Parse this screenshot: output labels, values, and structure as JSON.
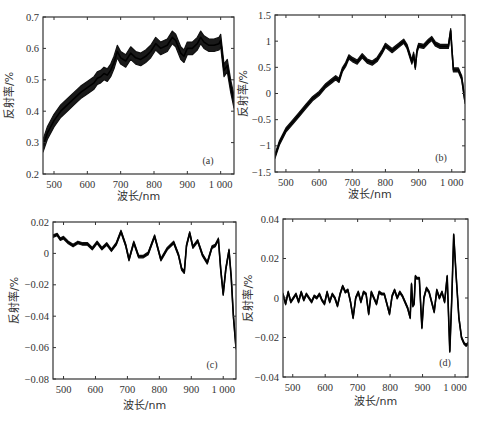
{
  "figure": {
    "xlabel": "波长/nm",
    "ylabel": "反射率/%"
  },
  "chart_data": [
    {
      "type": "line",
      "panel": "(a)",
      "xlabel": "波长/nm",
      "ylabel": "反射率/%",
      "xlim": [
        467,
        1040
      ],
      "ylim": [
        0.2,
        0.7
      ],
      "xticks": [
        500,
        600,
        700,
        800,
        900,
        1000
      ],
      "xticklabels": [
        "500",
        "600",
        "700",
        "800",
        "900",
        "1 000"
      ],
      "yticks": [
        0.2,
        0.3,
        0.4,
        0.5,
        0.6,
        0.7
      ],
      "yticklabels": [
        "0.2",
        "0.3",
        "0.4",
        "0.5",
        "0.6",
        "0.7"
      ],
      "band_halfwidth": 0.02,
      "x": [
        467,
        480,
        500,
        520,
        540,
        560,
        580,
        600,
        620,
        630,
        640,
        650,
        660,
        670,
        680,
        690,
        700,
        715,
        730,
        745,
        760,
        775,
        790,
        805,
        820,
        840,
        855,
        865,
        880,
        890,
        900,
        915,
        930,
        940,
        950,
        965,
        980,
        995,
        1000,
        1010,
        1020,
        1030,
        1040
      ],
      "y": [
        0.29,
        0.33,
        0.37,
        0.4,
        0.42,
        0.44,
        0.46,
        0.475,
        0.49,
        0.505,
        0.51,
        0.52,
        0.515,
        0.53,
        0.555,
        0.59,
        0.57,
        0.56,
        0.585,
        0.57,
        0.565,
        0.575,
        0.59,
        0.615,
        0.6,
        0.61,
        0.635,
        0.625,
        0.585,
        0.575,
        0.6,
        0.6,
        0.615,
        0.635,
        0.62,
        0.61,
        0.61,
        0.615,
        0.625,
        0.53,
        0.545,
        0.48,
        0.43
      ]
    },
    {
      "type": "line",
      "panel": "(b)",
      "xlabel": "波长/nm",
      "ylabel": "反射率/%",
      "xlim": [
        467,
        1040
      ],
      "ylim": [
        -1.5,
        1.5
      ],
      "xticks": [
        500,
        600,
        700,
        800,
        900,
        1000
      ],
      "xticklabels": [
        "500",
        "600",
        "700",
        "800",
        "900",
        "1 000"
      ],
      "yticks": [
        -1.5,
        -1,
        -0.5,
        0,
        0.5,
        1,
        1.5
      ],
      "yticklabels": [
        "-1.5",
        "-1",
        "-0.5",
        "0",
        "0.5",
        "1",
        "1.5"
      ],
      "band_halfwidth": 0.04,
      "x": [
        467,
        480,
        500,
        520,
        540,
        560,
        580,
        600,
        620,
        640,
        650,
        660,
        670,
        680,
        690,
        700,
        715,
        730,
        745,
        760,
        775,
        790,
        800,
        820,
        840,
        855,
        865,
        875,
        880,
        885,
        890,
        895,
        900,
        915,
        930,
        940,
        950,
        965,
        980,
        990,
        997,
        1000,
        1005,
        1020,
        1030,
        1040
      ],
      "y": [
        -1.2,
        -0.95,
        -0.7,
        -0.55,
        -0.4,
        -0.25,
        -0.1,
        0.0,
        0.15,
        0.25,
        0.3,
        0.25,
        0.45,
        0.55,
        0.7,
        0.65,
        0.6,
        0.72,
        0.62,
        0.58,
        0.65,
        0.8,
        0.92,
        0.82,
        0.92,
        1.0,
        0.9,
        0.7,
        0.6,
        0.75,
        0.5,
        0.8,
        0.92,
        0.9,
        1.0,
        1.05,
        0.95,
        0.9,
        0.9,
        0.9,
        1.2,
        0.9,
        0.45,
        0.45,
        0.3,
        -0.15
      ]
    },
    {
      "type": "line",
      "panel": "(c)",
      "xlabel": "波长/nm",
      "ylabel": "反射率/%",
      "xlim": [
        467,
        1040
      ],
      "ylim": [
        -0.08,
        0.02
      ],
      "xticks": [
        500,
        600,
        700,
        800,
        900,
        1000
      ],
      "xticklabels": [
        "500",
        "600",
        "700",
        "800",
        "900",
        "1 000"
      ],
      "yticks": [
        -0.08,
        -0.06,
        -0.04,
        -0.02,
        0,
        0.02
      ],
      "yticklabels": [
        "-0.08",
        "-0.06",
        "-0.04",
        "-0.02",
        "0",
        "0.02"
      ],
      "band_halfwidth": 0.0008,
      "x": [
        467,
        480,
        490,
        500,
        515,
        530,
        545,
        560,
        575,
        590,
        605,
        620,
        635,
        650,
        665,
        680,
        695,
        705,
        720,
        735,
        750,
        765,
        785,
        805,
        825,
        845,
        860,
        870,
        878,
        885,
        895,
        905,
        920,
        935,
        950,
        965,
        975,
        985,
        992,
        1000,
        1008,
        1018,
        1025,
        1032,
        1040
      ],
      "y": [
        0.011,
        0.012,
        0.009,
        0.01,
        0.007,
        0.005,
        0.007,
        0.006,
        0.006,
        0.003,
        0.007,
        0.003,
        0.006,
        0.002,
        0.006,
        0.014,
        0.005,
        -0.004,
        0.007,
        -0.002,
        -0.002,
        0.0,
        0.011,
        -0.004,
        0.003,
        0.007,
        -0.001,
        -0.01,
        -0.012,
        0.005,
        0.013,
        0.004,
        0.008,
        -0.001,
        -0.006,
        0.004,
        0.005,
        0.009,
        -0.01,
        -0.026,
        -0.01,
        0.002,
        -0.015,
        -0.04,
        -0.06
      ]
    },
    {
      "type": "line",
      "panel": "(d)",
      "xlabel": "波长/nm",
      "ylabel": "反射率/%",
      "xlim": [
        470,
        1040
      ],
      "ylim": [
        -0.04,
        0.04
      ],
      "xticks": [
        500,
        600,
        700,
        800,
        900,
        1000
      ],
      "xticklabels": [
        "500",
        "600",
        "700",
        "800",
        "900",
        "1 000"
      ],
      "yticks": [
        -0.04,
        -0.02,
        0,
        0.02,
        0.04
      ],
      "yticklabels": [
        "-0.04",
        "-0.02",
        "0",
        "0.02",
        "0.04"
      ],
      "band_halfwidth": 0.0005,
      "x": [
        470,
        478,
        486,
        494,
        502,
        510,
        518,
        526,
        534,
        542,
        550,
        558,
        566,
        574,
        582,
        590,
        598,
        606,
        614,
        622,
        630,
        638,
        646,
        654,
        662,
        670,
        678,
        686,
        694,
        702,
        710,
        718,
        726,
        734,
        742,
        750,
        758,
        766,
        774,
        782,
        790,
        798,
        806,
        814,
        822,
        830,
        838,
        846,
        854,
        862,
        866,
        870,
        874,
        878,
        882,
        890,
        898,
        904,
        912,
        920,
        928,
        936,
        944,
        952,
        960,
        968,
        976,
        984,
        990,
        996,
        1004,
        1012,
        1020,
        1028,
        1034,
        1040
      ],
      "y": [
        0.002,
        -0.003,
        0.003,
        -0.002,
        0.0,
        0.002,
        -0.002,
        0.003,
        -0.001,
        0.002,
        0.0,
        -0.002,
        0.001,
        0.0,
        0.002,
        -0.001,
        -0.003,
        0.003,
        -0.002,
        0.002,
        0.0,
        -0.004,
        0.002,
        0.006,
        0.003,
        0.004,
        -0.002,
        -0.01,
        0.0,
        0.003,
        -0.002,
        0.003,
        0.002,
        -0.008,
        0.003,
        0.0,
        -0.003,
        0.003,
        0.002,
        0.002,
        -0.003,
        -0.008,
        0.001,
        0.004,
        0.0,
        0.003,
        0.001,
        -0.002,
        -0.005,
        -0.01,
        0.007,
        -0.004,
        -0.003,
        0.011,
        0.01,
        0.01,
        -0.015,
        0.0,
        0.005,
        0.003,
        -0.002,
        -0.007,
        0.004,
        0.0,
        0.003,
        -0.002,
        0.011,
        -0.027,
        0.0,
        0.032,
        0.01,
        -0.01,
        -0.02,
        -0.023,
        -0.024,
        -0.023
      ]
    }
  ]
}
